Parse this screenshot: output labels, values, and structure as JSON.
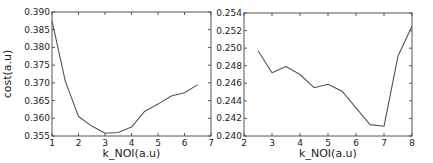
{
  "chart_data": [
    {
      "type": "line",
      "title": "",
      "xlabel": "k_NOI(a.u)",
      "ylabel": "cost(a.u)",
      "xlim": [
        1,
        7
      ],
      "ylim": [
        0.355,
        0.39
      ],
      "xticks": [
        "1",
        "2",
        "3",
        "4",
        "5",
        "6",
        "7"
      ],
      "yticks": [
        "0.355",
        "0.360",
        "0.365",
        "0.370",
        "0.375",
        "0.380",
        "0.385",
        "0.390"
      ],
      "grid": false,
      "legend": null,
      "series": [
        {
          "name": "cost",
          "color": "#555555",
          "x": [
            1,
            1.5,
            2,
            2.5,
            3,
            3.5,
            4,
            4.5,
            5,
            5.5,
            6,
            6.5
          ],
          "values": [
            0.3875,
            0.3705,
            0.3605,
            0.3578,
            0.3558,
            0.356,
            0.3575,
            0.362,
            0.364,
            0.3663,
            0.3672,
            0.3695
          ]
        }
      ]
    },
    {
      "type": "line",
      "title": "",
      "xlabel": "k_NOI(a.u)",
      "ylabel": "",
      "xlim": [
        2,
        8
      ],
      "ylim": [
        0.24,
        0.254
      ],
      "xticks": [
        "2",
        "3",
        "4",
        "5",
        "6",
        "7",
        "8"
      ],
      "yticks": [
        "0.240",
        "0.242",
        "0.244",
        "0.246",
        "0.248",
        "0.250",
        "0.252",
        "0.254"
      ],
      "grid": false,
      "legend": null,
      "series": [
        {
          "name": "cost",
          "color": "#555555",
          "x": [
            2.5,
            3,
            3.5,
            4,
            4.5,
            5,
            5.5,
            6,
            6.5,
            7,
            7.5,
            8
          ],
          "values": [
            0.2497,
            0.2472,
            0.2479,
            0.247,
            0.2455,
            0.2459,
            0.2451,
            0.2432,
            0.2413,
            0.2411,
            0.2491,
            0.2525
          ]
        }
      ]
    }
  ],
  "layout": {
    "panels": [
      {
        "left": 52,
        "top": 12,
        "right": 211,
        "bottom": 136
      },
      {
        "left": 244,
        "top": 13,
        "right": 412,
        "bottom": 136
      }
    ]
  }
}
